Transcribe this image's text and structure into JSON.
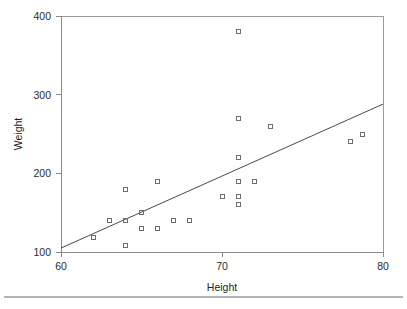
{
  "figure": {
    "background_color": "#ffffff",
    "axis_color": "#8a8a8a",
    "marker_color": "#6e6e6e",
    "line_color": "#4a4a4a",
    "footer_rule_color": "#b4b4b4"
  },
  "chart_data": {
    "type": "scatter",
    "title": "",
    "subtitle": "",
    "xlabel": "Height",
    "ylabel": "Weight",
    "xlim": [
      60,
      80
    ],
    "ylim": [
      100,
      400
    ],
    "xticks": [
      60,
      70,
      80
    ],
    "xtick_labels": [
      "60",
      "70",
      "80"
    ],
    "yticks": [
      100,
      200,
      300,
      400
    ],
    "ytick_labels": [
      "100",
      "200",
      "300",
      "400"
    ],
    "grid": false,
    "legend": null,
    "legend_position": "none",
    "marker_style": "open-square",
    "annotations": [],
    "points": [
      {
        "x": 62.0,
        "y": 118
      },
      {
        "x": 63.0,
        "y": 140
      },
      {
        "x": 64.0,
        "y": 180
      },
      {
        "x": 64.0,
        "y": 140
      },
      {
        "x": 64.0,
        "y": 108
      },
      {
        "x": 65.0,
        "y": 150
      },
      {
        "x": 65.0,
        "y": 130
      },
      {
        "x": 66.0,
        "y": 190
      },
      {
        "x": 66.0,
        "y": 130
      },
      {
        "x": 67.0,
        "y": 140
      },
      {
        "x": 68.0,
        "y": 140
      },
      {
        "x": 70.0,
        "y": 170
      },
      {
        "x": 71.0,
        "y": 380
      },
      {
        "x": 71.0,
        "y": 270
      },
      {
        "x": 71.0,
        "y": 220
      },
      {
        "x": 71.0,
        "y": 190
      },
      {
        "x": 71.0,
        "y": 170
      },
      {
        "x": 71.0,
        "y": 160
      },
      {
        "x": 72.0,
        "y": 190
      },
      {
        "x": 73.0,
        "y": 260
      },
      {
        "x": 78.0,
        "y": 240
      },
      {
        "x": 78.7,
        "y": 250
      }
    ],
    "series": [
      {
        "name": "regression-line",
        "type": "line",
        "x": [
          60,
          80
        ],
        "y": [
          105,
          288
        ]
      }
    ]
  }
}
